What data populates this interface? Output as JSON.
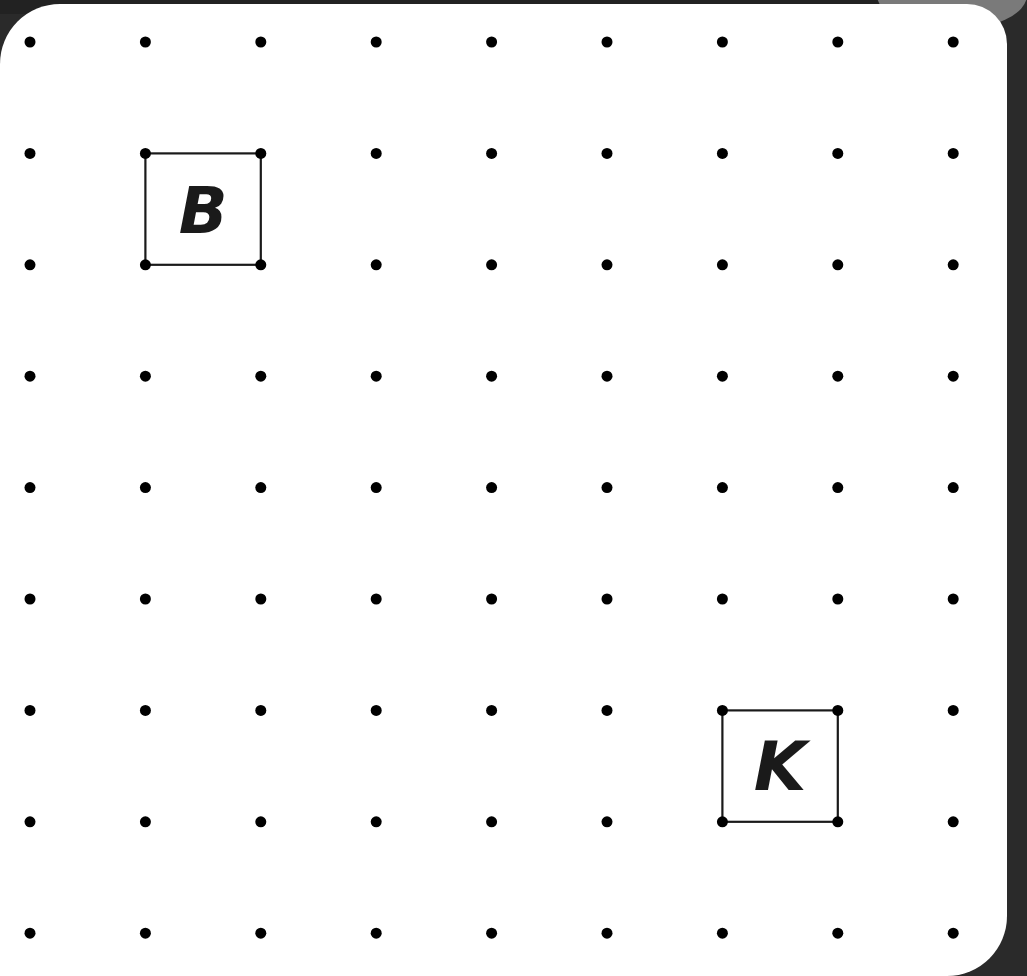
{
  "board": {
    "columns": 9,
    "rows": 9,
    "origin_x": 30,
    "origin_y": 42,
    "spacing_x": 115.4,
    "spacing_y": 111.4,
    "dot_color": "#000000",
    "dot_radius": 5.5
  },
  "squares": [
    {
      "label": "B",
      "col": 1,
      "row": 1,
      "size": 1
    },
    {
      "label": "K",
      "col": 6,
      "row": 6,
      "size": 1
    }
  ],
  "labels": {
    "square_b": "B",
    "square_k": "K"
  }
}
